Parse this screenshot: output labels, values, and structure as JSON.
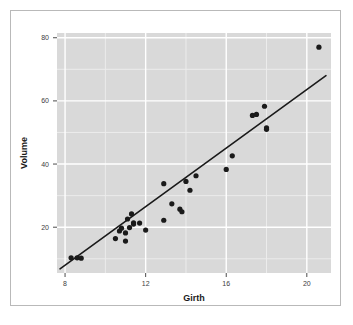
{
  "figure": {
    "background_color": "#ffffff",
    "frame_border_color": "#b9b9b9",
    "panel_background_color": "#d9d9d9",
    "major_grid_color": "#ffffff",
    "minor_grid_color": "#ececec",
    "point_color": "#1a1a1a",
    "line_color": "#1a1a1a",
    "tick_color": "#4d4d4d"
  },
  "chart_data": {
    "type": "scatter",
    "title": "",
    "xlabel": "Girth",
    "ylabel": "Volume",
    "xlim": [
      7.6,
      21.2
    ],
    "ylim": [
      5.5,
      81.5
    ],
    "xticks": [
      8,
      12,
      16,
      20
    ],
    "xtick_labels": [
      "8",
      "12",
      "16",
      "20"
    ],
    "yticks": [
      20,
      40,
      60,
      80
    ],
    "ytick_labels": [
      "20",
      "40",
      "60",
      "80"
    ],
    "x_minor_ticks": [
      10,
      14,
      18
    ],
    "y_minor_ticks": [
      10,
      30,
      50,
      70
    ],
    "grid": true,
    "legend": false,
    "point_size": 2.6,
    "x": [
      8.3,
      8.6,
      8.8,
      10.5,
      10.7,
      10.8,
      11.0,
      11.0,
      11.1,
      11.2,
      11.3,
      11.4,
      11.4,
      11.7,
      12.0,
      12.9,
      12.9,
      13.3,
      13.7,
      13.8,
      14.0,
      14.2,
      14.5,
      16.0,
      16.3,
      17.3,
      17.5,
      17.9,
      18.0,
      18.0,
      20.6
    ],
    "y": [
      10.3,
      10.3,
      10.2,
      16.4,
      18.8,
      19.7,
      15.6,
      18.2,
      22.6,
      19.9,
      24.2,
      21.0,
      21.4,
      21.3,
      19.1,
      22.2,
      33.8,
      27.4,
      25.7,
      24.9,
      34.5,
      31.7,
      36.3,
      38.3,
      42.6,
      55.4,
      55.7,
      58.3,
      51.5,
      51.0,
      77.0
    ],
    "fit_line": {
      "type": "linear-regression",
      "x_start": 7.75,
      "y_start": 6.8,
      "x_end": 20.95,
      "y_end": 68.0
    }
  },
  "axis_titles": {
    "x": "Girth",
    "y": "Volume"
  }
}
